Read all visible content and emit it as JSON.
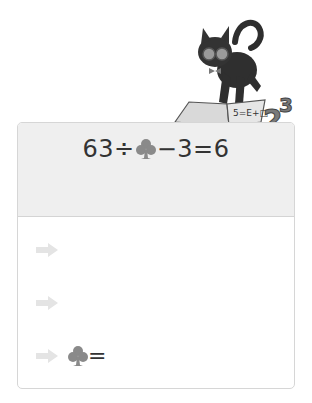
{
  "illustration": {
    "subject": "black cat with glasses and bow tie standing on open book",
    "book_text": "5=E+□",
    "numbers": "23"
  },
  "problem": {
    "equation_parts": [
      "63",
      "÷",
      "club",
      "−",
      "3",
      "=",
      "6"
    ],
    "left": "63÷",
    "right": "−3=6",
    "unknown_symbol": "club-icon"
  },
  "steps": [
    {
      "icon": "arrow-right-icon",
      "text": ""
    },
    {
      "icon": "arrow-right-icon",
      "text": ""
    },
    {
      "icon": "arrow-right-icon",
      "symbol": "club-icon",
      "text": "="
    }
  ],
  "colors": {
    "header_bg": "#efefef",
    "border": "#d6d6d6",
    "club": "#8a8a8a",
    "arrow": "#e4e4e4",
    "text": "#333333"
  }
}
